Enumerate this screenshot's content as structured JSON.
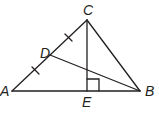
{
  "diagram": {
    "type": "geometry-triangle",
    "stroke_color": "#231f20",
    "points": {
      "A": {
        "label": "A",
        "x": 12,
        "y": 91
      },
      "B": {
        "label": "B",
        "x": 140,
        "y": 91
      },
      "C": {
        "label": "C",
        "x": 87,
        "y": 20
      },
      "D": {
        "label": "D",
        "x": 50,
        "y": 55
      },
      "E": {
        "label": "E",
        "x": 87,
        "y": 91
      }
    },
    "segments": [
      "AB",
      "BC",
      "CA",
      "CE",
      "DB"
    ],
    "congruence_marks": [
      "AD",
      "DC"
    ],
    "right_angle_at": "E"
  }
}
